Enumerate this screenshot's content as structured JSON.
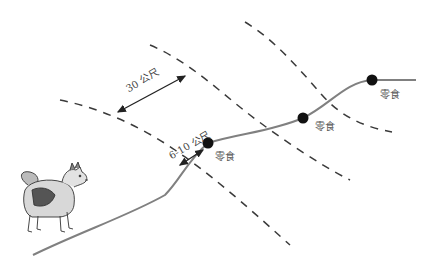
{
  "diagram": {
    "type": "tracking-trail-illustration",
    "colors": {
      "background": "#ffffff",
      "trail": "#808080",
      "dashed_boundary": "#3a3a3a",
      "snack_marker": "#111111",
      "arrow": "#222222",
      "text": "#444444"
    },
    "measurements": {
      "band_width_label": "30 公尺",
      "snack_offset_label": "6-10 公尺"
    },
    "snack_markers": [
      {
        "label": "零食",
        "x": 208,
        "y": 143
      },
      {
        "label": "零食",
        "x": 303,
        "y": 118
      },
      {
        "label": "零食",
        "x": 372,
        "y": 80
      }
    ],
    "dashed_lines": [
      {
        "id": "band-outer-left",
        "points": [
          [
            60,
            100
          ],
          [
            120,
            117
          ],
          [
            175,
            150
          ],
          [
            230,
            190
          ],
          [
            290,
            245
          ]
        ]
      },
      {
        "id": "band-outer-left-2",
        "points": [
          [
            150,
            45
          ],
          [
            200,
            70
          ],
          [
            250,
            115
          ],
          [
            300,
            152
          ],
          [
            350,
            180
          ]
        ]
      },
      {
        "id": "band-right",
        "points": [
          [
            245,
            22
          ],
          [
            285,
            50
          ],
          [
            330,
            100
          ],
          [
            360,
            122
          ],
          [
            392,
            132
          ]
        ]
      }
    ],
    "trail_points": [
      [
        33,
        255
      ],
      [
        90,
        228
      ],
      [
        140,
        210
      ],
      [
        172,
        190
      ],
      [
        190,
        160
      ],
      [
        208,
        143
      ],
      [
        240,
        136
      ],
      [
        270,
        130
      ],
      [
        303,
        118
      ],
      [
        330,
        100
      ],
      [
        350,
        87
      ],
      [
        372,
        80
      ],
      [
        416,
        80
      ]
    ],
    "figure": {
      "subject": "dog",
      "description": "spitz-type dog standing, facing right"
    }
  }
}
